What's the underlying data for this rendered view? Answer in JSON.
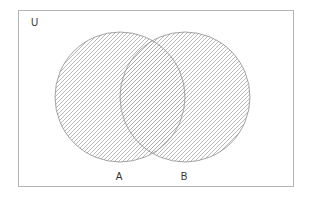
{
  "diagram": {
    "type": "venn",
    "universe": {
      "label": "U",
      "x": 18,
      "y": 10,
      "width": 275,
      "height": 176,
      "stroke": "#b4b4b4"
    },
    "sets": [
      {
        "label": "A",
        "cx": 120,
        "cy": 97,
        "r": 65,
        "label_x": 119,
        "label_y": 180
      },
      {
        "label": "B",
        "cx": 185,
        "cy": 97,
        "r": 65,
        "label_x": 184,
        "label_y": 180
      }
    ],
    "shaded_region": "A ∪ B",
    "hatch": {
      "direction": "forward-slash",
      "spacing": 4,
      "color": "#a8a8a8"
    },
    "circle_stroke": "#999999"
  }
}
